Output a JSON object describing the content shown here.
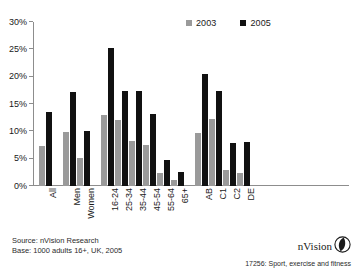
{
  "chart_data": {
    "type": "bar",
    "title": "",
    "subtitle": "",
    "xlabel": "",
    "ylabel": "",
    "ylim": [
      0,
      30
    ],
    "ytick_values": [
      0,
      5,
      10,
      15,
      20,
      25,
      30
    ],
    "ytick_labels": [
      "0%",
      "5%",
      "10%",
      "15%",
      "20%",
      "25%",
      "30%"
    ],
    "grid": false,
    "legend_position": "top-right",
    "categories": [
      "All",
      "Men",
      "Women",
      "16-24",
      "25-34",
      "35-44",
      "45-54",
      "55-64",
      "65+",
      "AB",
      "C1",
      "C2",
      "DE"
    ],
    "series": [
      {
        "name": "2003",
        "color": "#9a9a9a",
        "values": [
          7.3,
          9.8,
          5.1,
          13.0,
          12.1,
          8.3,
          7.5,
          2.4,
          1.1,
          9.7,
          12.3,
          3.0,
          2.3
        ]
      },
      {
        "name": "2005",
        "color": "#111111",
        "values": [
          13.6,
          17.2,
          10.1,
          25.3,
          17.3,
          17.3,
          13.2,
          4.7,
          2.6,
          20.5,
          17.3,
          7.9,
          8.0
        ]
      }
    ],
    "group_gaps_after": [
      "All",
      "Women",
      "65+"
    ]
  },
  "legend": {
    "items": [
      {
        "label": "2003",
        "swatch": "legend-swatch-2003"
      },
      {
        "label": "2005",
        "swatch": "legend-swatch-2005"
      }
    ]
  },
  "footnotes": {
    "source": "Source: nVision Research",
    "base": "Base: 1000 adults 16+, UK, 2005"
  },
  "branding": {
    "name": "nVision",
    "logo_icon": "nvision-leaf-logo-icon",
    "code": "17256: Sport, exercise and fitness"
  }
}
